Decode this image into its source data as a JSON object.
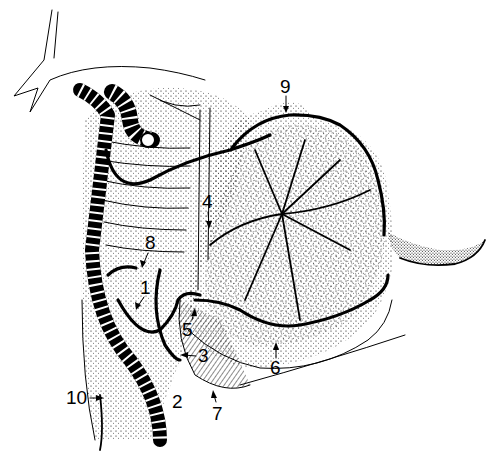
{
  "figure": {
    "colors": {
      "ink": "#000000",
      "background": "#ffffff"
    },
    "labels": [
      {
        "id": "1",
        "text": "1"
      },
      {
        "id": "2",
        "text": "2"
      },
      {
        "id": "3",
        "text": "3"
      },
      {
        "id": "4",
        "text": "4"
      },
      {
        "id": "5",
        "text": "5"
      },
      {
        "id": "6",
        "text": "6"
      },
      {
        "id": "7",
        "text": "7"
      },
      {
        "id": "8",
        "text": "8"
      },
      {
        "id": "9",
        "text": "9"
      },
      {
        "id": "10",
        "text": "10"
      }
    ]
  }
}
